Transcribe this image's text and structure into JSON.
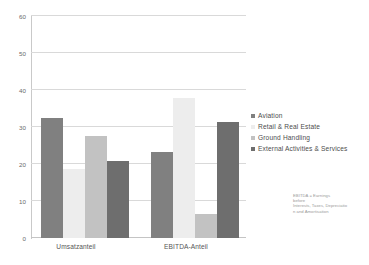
{
  "chart_data": {
    "type": "bar",
    "title": "",
    "subtitle": "",
    "xlabel": "",
    "ylabel": "",
    "categories": [
      "Umsatzanteil",
      "EBITDA-Anteil"
    ],
    "series": [
      {
        "name": "Aviation",
        "color": "#808080",
        "values": [
          32.5,
          23.2
        ]
      },
      {
        "name": "Retail & Real Estate",
        "color": "#ededed",
        "values": [
          18.7,
          37.8
        ]
      },
      {
        "name": "Ground Handling",
        "color": "#c2c2c2",
        "values": [
          27.5,
          6.6
        ]
      },
      {
        "name": "External Activities & Services",
        "color": "#6e6e6e",
        "values": [
          20.8,
          31.4
        ]
      }
    ],
    "ylim": [
      0,
      60
    ],
    "yticks": [
      0,
      10,
      20,
      30,
      40,
      50,
      60
    ],
    "ytick_labels": [
      "0",
      "10",
      "20",
      "30",
      "40",
      "50",
      "60"
    ],
    "grid": true,
    "legend_position": "right",
    "annotations": [
      "EBITDA = Earnings",
      "before",
      "Interests, Taxes, Depreciatio",
      "n and Amortisation"
    ]
  },
  "colors": {
    "background": "#ffffff",
    "gridline": "#d9d9d9",
    "axis": "#c9c9c9",
    "tick_text": "#6b6b6b",
    "legend_text": "#4d4d4d",
    "footnote_text": "#9a9a9a"
  }
}
